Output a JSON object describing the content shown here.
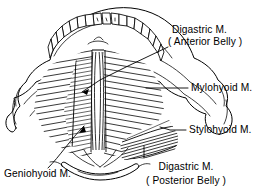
{
  "figure": {
    "view": "Superior / inferior view of mandible and hyoid",
    "background_color": "#ffffff",
    "ink_color": "#000000"
  },
  "labels": [
    {
      "id": "digastric-anterior",
      "name": "Digastric M.",
      "qualifier": "( Anterior Belly )",
      "line1": "Digastric M.",
      "line2": "( Anterior Belly )",
      "x": 172,
      "y": 33
    },
    {
      "id": "mylohyoid",
      "name": "Mylohyoid M.",
      "qualifier": "",
      "line1": "Mylohyoid M.",
      "line2": "",
      "x": 192,
      "y": 87
    },
    {
      "id": "stylohyoid",
      "name": "Stylohyoid M.",
      "qualifier": "",
      "line1": "Stylohyoid M.",
      "line2": "",
      "x": 190,
      "y": 130
    },
    {
      "id": "digastric-posterior",
      "name": "Digastric M.",
      "qualifier": "( Posterior Belly )",
      "line1": "Digastric M.",
      "line2": "( Posterior Belly )",
      "x": 186,
      "y": 167
    },
    {
      "id": "geniohyoid",
      "name": "Geniohyoid M.",
      "qualifier": "",
      "line1": "Geniohyoid M.",
      "line2": "",
      "x": 58,
      "y": 173
    }
  ],
  "structures": [
    {
      "id": "mandible",
      "name": "Mandible"
    },
    {
      "id": "teeth",
      "name": "Dental arch / teeth"
    },
    {
      "id": "hyoid",
      "name": "Hyoid bone"
    },
    {
      "id": "mylohyoid-raphe",
      "name": "Median mylohyoid raphe"
    },
    {
      "id": "coronoid-process",
      "name": "Coronoid process"
    },
    {
      "id": "condylar-process",
      "name": "Condylar process"
    }
  ],
  "teeth_count": 14
}
